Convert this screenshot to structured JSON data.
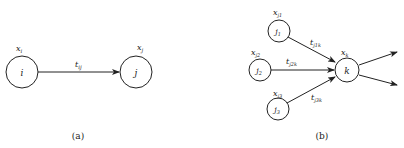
{
  "panels": [
    {
      "caption": "(a)",
      "nodes": [
        {
          "id": "i",
          "label": "i",
          "var": "x",
          "var_sub": "i"
        },
        {
          "id": "j",
          "label": "j",
          "var": "x",
          "var_sub": "j"
        }
      ],
      "edges": [
        {
          "from": "i",
          "to": "j",
          "label": "t",
          "label_sub": "ij"
        }
      ]
    },
    {
      "caption": "(b)",
      "nodes": [
        {
          "id": "j1",
          "label": "j",
          "label_sub": "1",
          "var": "x",
          "var_sub": "j1"
        },
        {
          "id": "j2",
          "label": "j",
          "label_sub": "2",
          "var": "x",
          "var_sub": "j2"
        },
        {
          "id": "j3",
          "label": "j",
          "label_sub": "3",
          "var": "x",
          "var_sub": "j3"
        },
        {
          "id": "k",
          "label": "k",
          "var": "x",
          "var_sub": "k"
        }
      ],
      "edges": [
        {
          "from": "j1",
          "to": "k",
          "label": "t",
          "label_sub": "j1k"
        },
        {
          "from": "j2",
          "to": "k",
          "label": "t",
          "label_sub": "j2k"
        },
        {
          "from": "j3",
          "to": "k",
          "label": "t",
          "label_sub": "j3k"
        },
        {
          "from": "k",
          "to": "out-upper",
          "label": ""
        },
        {
          "from": "k",
          "to": "out-lower",
          "label": ""
        }
      ]
    }
  ]
}
